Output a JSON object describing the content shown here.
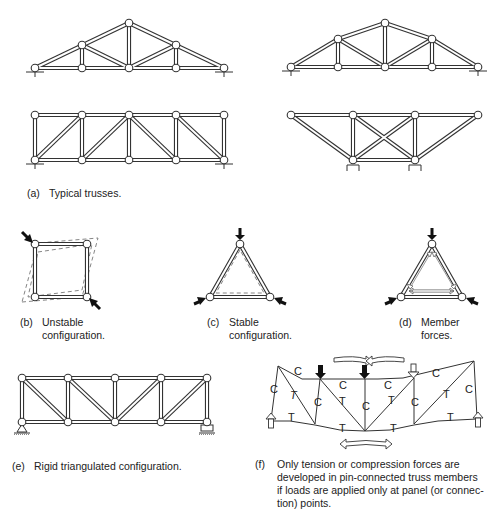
{
  "figure": {
    "panels": [
      {
        "id": "a",
        "tag": "(a)",
        "caption_lines": [
          "Typical trusses."
        ]
      },
      {
        "id": "b",
        "tag": "(b)",
        "caption_lines": [
          "Unstable",
          "configuration."
        ]
      },
      {
        "id": "c",
        "tag": "(c)",
        "caption_lines": [
          "Stable",
          "configuration."
        ]
      },
      {
        "id": "d",
        "tag": "(d)",
        "caption_lines": [
          "Member",
          "forces."
        ]
      },
      {
        "id": "e",
        "tag": "(e)",
        "caption_lines": [
          "Rigid triangulated configuration."
        ]
      },
      {
        "id": "f",
        "tag": "(f)",
        "caption_lines": [
          "Only tension or compression forces are",
          "developed in pin-connected truss members",
          "if loads are applied only at panel (or connec-",
          "tion) points."
        ]
      }
    ],
    "force_labels": {
      "compression": "C",
      "tension": "T"
    },
    "colors": {
      "line": "#333333",
      "dashed": "#777777",
      "arrow_fill": "#111111",
      "background": "#ffffff"
    }
  }
}
